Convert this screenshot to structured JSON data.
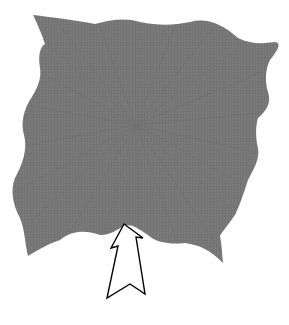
{
  "diagram": {
    "sheet": {
      "fill_color": "#7a7a7a",
      "texture_color": "#6b6b6b",
      "center": [
        136,
        125
      ]
    },
    "arrow": {
      "direction": "up",
      "fill_color": "#ffffff",
      "stroke_color": "#000000"
    }
  }
}
